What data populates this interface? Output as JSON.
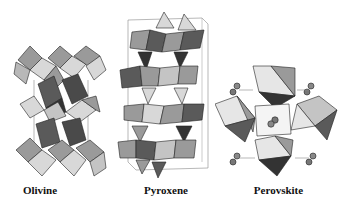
{
  "figure": {
    "panels": [
      {
        "id": "olivine",
        "label": "Olivine"
      },
      {
        "id": "pyroxene",
        "label": "Pyroxene"
      },
      {
        "id": "perovskite",
        "label": "Perovskite"
      }
    ],
    "colors": {
      "light": "#d8d8d8",
      "mid": "#9a9a9a",
      "dark": "#5a5a5a",
      "darkest": "#333333",
      "edge": "#222222",
      "cell": "#888888"
    }
  }
}
